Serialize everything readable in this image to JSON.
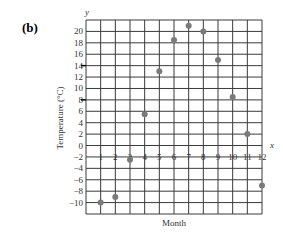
{
  "panel_label": "(b)",
  "chart_data": {
    "type": "scatter",
    "title": "",
    "panel": "(b)",
    "xlabel": "Month",
    "ylabel": "Temperature (°C)",
    "x_axis_letter": "x",
    "y_axis_letter": "y",
    "x": [
      1,
      2,
      3,
      4,
      5,
      6,
      7,
      8,
      9,
      10,
      11,
      12
    ],
    "y": [
      -10,
      -9,
      -2.5,
      5.5,
      13,
      18.5,
      21,
      20,
      15,
      8.5,
      2,
      -7
    ],
    "x_ticks": [
      "1",
      "2",
      "3",
      "4",
      "5",
      "6",
      "7",
      "8",
      "9",
      "10",
      "11",
      "12"
    ],
    "y_ticks": [
      "20",
      "18",
      "16",
      "14",
      "12",
      "10",
      "8",
      "6",
      "4",
      "2",
      "0",
      "-2",
      "-4",
      "-6",
      "-8",
      "-10"
    ],
    "xlim": [
      0,
      12
    ],
    "ylim": [
      -12,
      22
    ],
    "grid": true,
    "legend": null,
    "marker_color": "#7a7a7a",
    "grid_color": "#3a3a3a"
  }
}
